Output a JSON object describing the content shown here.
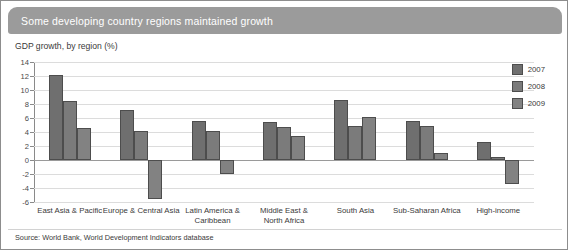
{
  "header": {
    "title": "Some developing country regions maintained growth"
  },
  "subtitle": "GDP growth, by region (%)",
  "source": "Source: World Bank, World Development Indicators database",
  "legend": {
    "position": "top-right",
    "entries": [
      {
        "label": "2007",
        "color": "#6f6f6f"
      },
      {
        "label": "2008",
        "color": "#7b7b7b"
      },
      {
        "label": "2009",
        "color": "#828282"
      }
    ]
  },
  "chart_data": {
    "type": "bar",
    "title": "Some developing country regions maintained growth",
    "subtitle": "GDP growth, by region (%)",
    "xlabel": "",
    "ylabel": "GDP growth, by region (%)",
    "ylim": [
      -6,
      14
    ],
    "yticks": [
      14,
      12,
      10,
      8,
      6,
      4,
      2,
      0,
      -2,
      -4,
      -6
    ],
    "ytick_labels": [
      "14",
      "12",
      "10",
      "8",
      "6",
      "4",
      "2",
      "0",
      "-2",
      "-4",
      "-6"
    ],
    "grid": true,
    "categories": [
      "East Asia & Pacific",
      "Europe & Central Asia",
      "Latin America & Caribbean",
      "Middle East & North Africa",
      "South Asia",
      "Sub-Saharan Africa",
      "High-income"
    ],
    "category_lines": [
      [
        "East Asia & Pacific"
      ],
      [
        "Europe & Central Asia"
      ],
      [
        "Latin America &",
        "Caribbean"
      ],
      [
        "Middle East &",
        "North Africa"
      ],
      [
        "South Asia"
      ],
      [
        "Sub-Saharan Africa"
      ],
      [
        "High-income"
      ]
    ],
    "series": [
      {
        "name": "2007",
        "color": "#6f6f6f",
        "values": [
          12.1,
          7.1,
          5.6,
          5.5,
          8.6,
          5.6,
          2.6
        ]
      },
      {
        "name": "2008",
        "color": "#7b7b7b",
        "values": [
          8.5,
          4.2,
          4.2,
          4.7,
          4.9,
          4.9,
          0.4
        ]
      },
      {
        "name": "2009",
        "color": "#828282",
        "values": [
          4.6,
          -5.6,
          -2.0,
          3.5,
          6.1,
          1.0,
          -3.4
        ]
      }
    ],
    "source": "Source: World Bank, World Development Indicators database"
  }
}
